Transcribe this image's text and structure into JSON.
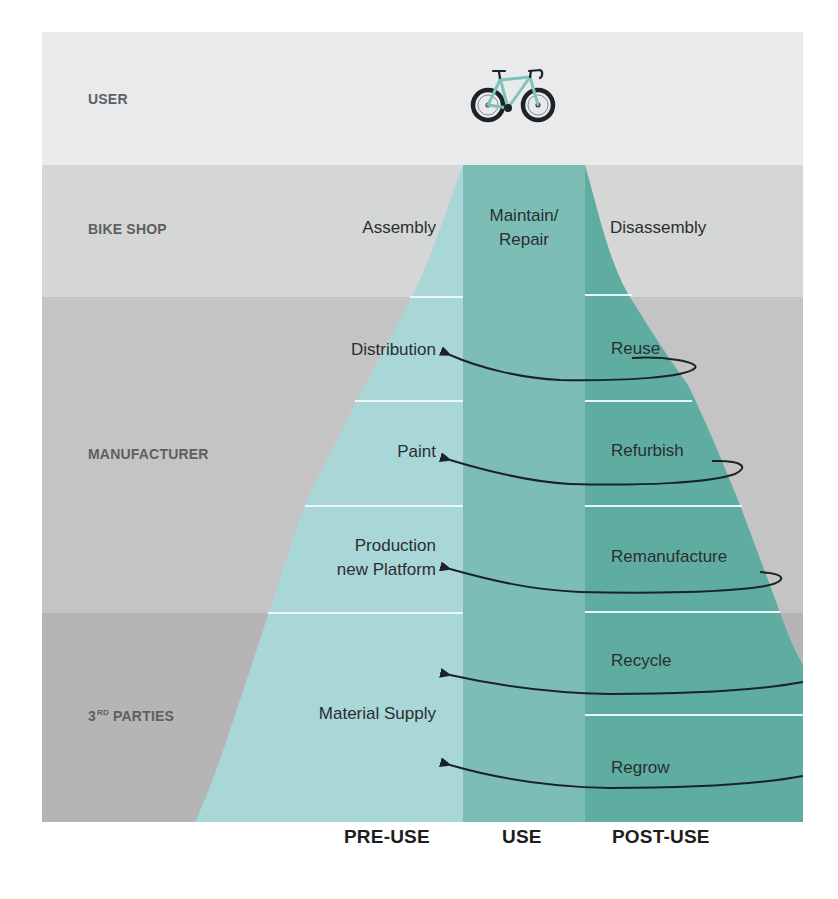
{
  "colors": {
    "user_band": "#e8eaeb",
    "bike_shop_band": "#d5d6d6",
    "manufacturer_band": "#c4c4c5",
    "third_parties_band": "#b5b5b6",
    "pre_use": "#a9d6d6",
    "use": "#7cbdb5",
    "post_use": "#5fada0",
    "arrow": "#1c2326",
    "separator": "#eaf7f6"
  },
  "bands": [
    {
      "id": "user",
      "label": "USER"
    },
    {
      "id": "bike_shop",
      "label": "BIKE SHOP"
    },
    {
      "id": "manufacturer",
      "label": "MANUFACTURER"
    },
    {
      "id": "third_parties",
      "label_main": "3",
      "label_sup": "RD",
      "label_rest": " PARTIES"
    }
  ],
  "pre_use_stages": [
    {
      "label": "Assembly"
    },
    {
      "label": "Distribution"
    },
    {
      "label": "Paint"
    },
    {
      "label_line1": "Production",
      "label_line2": "new Platform"
    },
    {
      "label": "Material Supply"
    }
  ],
  "use_stage": {
    "label_line1": "Maintain/",
    "label_line2": "Repair"
  },
  "post_use_stages": [
    {
      "label": "Disassembly"
    },
    {
      "label": "Reuse"
    },
    {
      "label": "Refurbish"
    },
    {
      "label": "Remanufacture"
    },
    {
      "label": "Recycle"
    },
    {
      "label": "Regrow"
    }
  ],
  "phases": [
    {
      "label": "PRE-USE"
    },
    {
      "label": "USE"
    },
    {
      "label": "POST-USE"
    }
  ],
  "icons": {
    "user_icon": "road-bike-icon"
  }
}
